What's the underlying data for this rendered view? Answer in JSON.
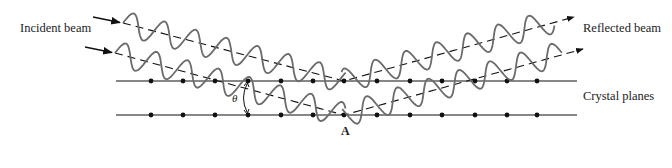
{
  "labels": {
    "incident": "Incident beam",
    "reflected": "Reflected beam",
    "planes": "Crystal planes",
    "angle": "θ",
    "point": "A"
  },
  "geometry": {
    "plane_y": [
      81,
      115
    ],
    "plane_x": [
      116,
      577
    ],
    "atom_x": [
      151,
      183,
      215,
      248,
      281,
      313,
      344,
      377,
      410,
      442,
      475,
      507,
      537
    ],
    "vertex_x": 344,
    "beams": [
      {
        "start": [
          123,
          23
        ],
        "vertex_y": 81,
        "end": [
          574,
          17
        ]
      },
      {
        "start": [
          115,
          53
        ],
        "vertex_y": 115,
        "end": [
          583,
          49
        ]
      }
    ]
  },
  "colors": {
    "line": "#111111",
    "wave": "#6b6b6b"
  }
}
